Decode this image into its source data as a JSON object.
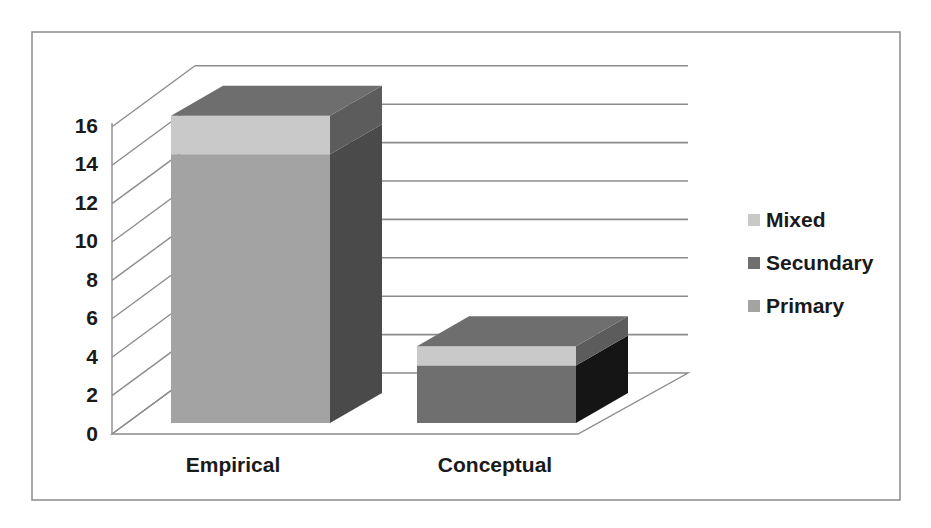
{
  "chart_data": {
    "type": "bar",
    "subtype": "stacked-3d-column",
    "title": "",
    "xlabel": "",
    "ylabel": "",
    "categories": [
      "Empirical",
      "Conceptual"
    ],
    "series": [
      {
        "name": "Primary",
        "values": [
          14,
          0
        ],
        "color": "#a3a3a3",
        "side_color": "#4a4a4a",
        "top_color": "#7a7a7a"
      },
      {
        "name": "Secundary",
        "values": [
          0,
          3
        ],
        "color": "#6f6f6f",
        "side_color": "#151515",
        "top_color": "#6a6a6a"
      },
      {
        "name": "Mixed",
        "values": [
          2,
          1
        ],
        "color": "#c9c9c9",
        "side_color": "#5c5c5c",
        "top_color": "#6e6e6e"
      }
    ],
    "totals": [
      16,
      4
    ],
    "ylim": [
      0,
      16
    ],
    "yticks": [
      0,
      2,
      4,
      6,
      8,
      10,
      12,
      14,
      16
    ],
    "grid": true,
    "legend": {
      "position": "right",
      "order": [
        "Mixed",
        "Secundary",
        "Primary"
      ]
    }
  },
  "axis": {
    "tick_labels": [
      "0",
      "2",
      "4",
      "6",
      "8",
      "10",
      "12",
      "14",
      "16"
    ]
  },
  "categories": {
    "labels": [
      "Empirical",
      "Conceptual"
    ]
  },
  "legend": {
    "items": [
      {
        "label": "Mixed",
        "color": "#c9c9c9"
      },
      {
        "label": "Secundary",
        "color": "#6f6f6f"
      },
      {
        "label": "Primary",
        "color": "#a3a3a3"
      }
    ]
  }
}
